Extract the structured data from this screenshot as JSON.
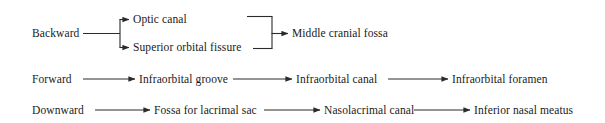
{
  "diagram": {
    "type": "flow-diagram",
    "background_color": "#ffffff",
    "line_color": "#2b2b2b",
    "text_color": "#1a1a1a",
    "rows": [
      {
        "id": "backward",
        "direction_label": "Backward",
        "branch_nodes": [
          "Optic canal",
          "Superior orbital fissure"
        ],
        "merge_node": "Middle cranial fossa"
      },
      {
        "id": "forward",
        "direction_label": "Forward",
        "chain_nodes": [
          "Infraorbital groove",
          "Infraorbital canal",
          "Infraorbital foramen"
        ]
      },
      {
        "id": "downward",
        "direction_label": "Downward",
        "chain_nodes": [
          "Fossa for lacrimal sac",
          "Nasolacrimal canal",
          "Inferior nasal meatus"
        ]
      }
    ],
    "nodes": {
      "backward": "Backward",
      "optic_canal": "Optic canal",
      "superior_orbital_fissure": "Superior orbital fissure",
      "middle_cranial_fossa": "Middle cranial fossa",
      "forward": "Forward",
      "infraorbital_groove": "Infraorbital groove",
      "infraorbital_canal": "Infraorbital canal",
      "infraorbital_foramen": "Infraorbital foramen",
      "downward": "Downward",
      "fossa_for_lacrimal_sac": "Fossa for lacrimal sac",
      "nasolacrimal_canal": "Nasolacrimal canal",
      "inferior_nasal_meatus": "Inferior nasal meatus"
    }
  }
}
